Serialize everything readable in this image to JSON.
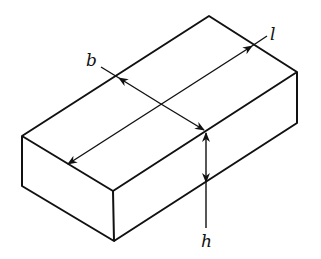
{
  "diagram": {
    "stroke_color": "#111111",
    "background": "#ffffff",
    "labels": {
      "length": "l",
      "breadth": "b",
      "height": "h"
    },
    "dimensions": [
      {
        "name": "length",
        "label": "l",
        "description": "double-headed arrow along top face, long direction"
      },
      {
        "name": "breadth",
        "label": "b",
        "description": "double-headed arrow across top face, short direction"
      },
      {
        "name": "height",
        "label": "h",
        "description": "double-headed arrow on front-right face, vertical"
      }
    ]
  }
}
